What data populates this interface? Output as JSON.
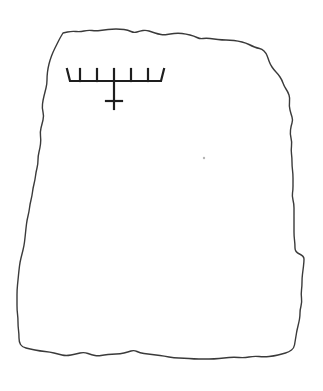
{
  "figure": {
    "stone": {
      "stroke_color": "#3a3a3a",
      "outline_points": [
        [
          63,
          33
        ],
        [
          72,
          31
        ],
        [
          80,
          32
        ],
        [
          88,
          30
        ],
        [
          96,
          31
        ],
        [
          104,
          30
        ],
        [
          112,
          29
        ],
        [
          120,
          29
        ],
        [
          128,
          30
        ],
        [
          134,
          33
        ],
        [
          140,
          31
        ],
        [
          146,
          30
        ],
        [
          152,
          32
        ],
        [
          158,
          34
        ],
        [
          164,
          35
        ],
        [
          170,
          34
        ],
        [
          178,
          33
        ],
        [
          186,
          34
        ],
        [
          194,
          36
        ],
        [
          200,
          39
        ],
        [
          206,
          38
        ],
        [
          214,
          39
        ],
        [
          222,
          40
        ],
        [
          230,
          40
        ],
        [
          238,
          41
        ],
        [
          246,
          43
        ],
        [
          252,
          46
        ],
        [
          257,
          48
        ],
        [
          262,
          49
        ],
        [
          266,
          53
        ],
        [
          268,
          58
        ],
        [
          270,
          64
        ],
        [
          274,
          70
        ],
        [
          278,
          74
        ],
        [
          282,
          80
        ],
        [
          284,
          86
        ],
        [
          288,
          92
        ],
        [
          290,
          98
        ],
        [
          289,
          106
        ],
        [
          291,
          114
        ],
        [
          293,
          120
        ],
        [
          291,
          126
        ],
        [
          290,
          134
        ],
        [
          292,
          142
        ],
        [
          291,
          150
        ],
        [
          292,
          158
        ],
        [
          292,
          166
        ],
        [
          293,
          174
        ],
        [
          293,
          182
        ],
        [
          293,
          190
        ],
        [
          292,
          196
        ],
        [
          294,
          204
        ],
        [
          294,
          212
        ],
        [
          294,
          220
        ],
        [
          294,
          228
        ],
        [
          294,
          236
        ],
        [
          295,
          244
        ],
        [
          295,
          252
        ],
        [
          304,
          256
        ],
        [
          304,
          262
        ],
        [
          303,
          270
        ],
        [
          302,
          278
        ],
        [
          302,
          286
        ],
        [
          301,
          294
        ],
        [
          302,
          302
        ],
        [
          300,
          310
        ],
        [
          300,
          316
        ],
        [
          299,
          322
        ],
        [
          297,
          330
        ],
        [
          296,
          336
        ],
        [
          295,
          342
        ],
        [
          294,
          348
        ],
        [
          289,
          352
        ],
        [
          282,
          354
        ],
        [
          274,
          356
        ],
        [
          264,
          357
        ],
        [
          254,
          356
        ],
        [
          244,
          358
        ],
        [
          234,
          357
        ],
        [
          224,
          358
        ],
        [
          214,
          359
        ],
        [
          204,
          359
        ],
        [
          194,
          359
        ],
        [
          184,
          358
        ],
        [
          174,
          358
        ],
        [
          164,
          356
        ],
        [
          156,
          355
        ],
        [
          148,
          354
        ],
        [
          140,
          353
        ],
        [
          134,
          350
        ],
        [
          128,
          352
        ],
        [
          120,
          354
        ],
        [
          112,
          354
        ],
        [
          104,
          355
        ],
        [
          98,
          356
        ],
        [
          92,
          355
        ],
        [
          84,
          352
        ],
        [
          76,
          354
        ],
        [
          66,
          356
        ],
        [
          58,
          354
        ],
        [
          50,
          352
        ],
        [
          40,
          351
        ],
        [
          30,
          349
        ],
        [
          22,
          347
        ],
        [
          19,
          342
        ],
        [
          19,
          334
        ],
        [
          18,
          326
        ],
        [
          18,
          318
        ],
        [
          17,
          310
        ],
        [
          17,
          300
        ],
        [
          17,
          290
        ],
        [
          18,
          280
        ],
        [
          19,
          270
        ],
        [
          20,
          262
        ],
        [
          22,
          254
        ],
        [
          24,
          246
        ],
        [
          25,
          238
        ],
        [
          26,
          228
        ],
        [
          27,
          220
        ],
        [
          29,
          212
        ],
        [
          30,
          204
        ],
        [
          32,
          196
        ],
        [
          33,
          188
        ],
        [
          35,
          180
        ],
        [
          36,
          172
        ],
        [
          38,
          164
        ],
        [
          38,
          156
        ],
        [
          40,
          148
        ],
        [
          41,
          140
        ],
        [
          40,
          132
        ],
        [
          42,
          124
        ],
        [
          44,
          116
        ],
        [
          42,
          108
        ],
        [
          43,
          100
        ],
        [
          45,
          92
        ],
        [
          47,
          84
        ],
        [
          47,
          76
        ],
        [
          48,
          68
        ],
        [
          50,
          60
        ],
        [
          53,
          52
        ],
        [
          57,
          44
        ],
        [
          60,
          38
        ],
        [
          63,
          33
        ]
      ]
    },
    "menorah": {
      "stroke_color": "#1e1e1e",
      "base_bar": {
        "x1": 70,
        "x2": 161,
        "y": 81
      },
      "left_arm_tip": [
        67,
        69
      ],
      "right_arm_tip": [
        164,
        69
      ],
      "branch_x": [
        80,
        97,
        114,
        131,
        148
      ],
      "branch_top_y": 69,
      "stem": {
        "x": 114,
        "y1": 81,
        "y2": 109
      },
      "crossbar": {
        "x1": 106,
        "x2": 122,
        "y": 101
      }
    },
    "specks": [
      {
        "x": 204,
        "y": 158,
        "r": 1.2
      }
    ]
  }
}
